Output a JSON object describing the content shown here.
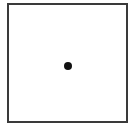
{
  "figure": {
    "shape": "square-frame",
    "border_color": "#3a3a3a",
    "background_color": "#ffffff",
    "marker": {
      "shape": "circle",
      "position": "center",
      "color": "#111111"
    }
  }
}
